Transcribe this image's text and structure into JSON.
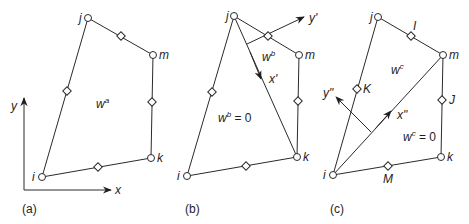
{
  "figure": {
    "panels": [
      {
        "caption": "(a)",
        "nodes": {
          "i": "i",
          "j": "j",
          "m": "m",
          "k": "k"
        },
        "axes": {
          "x": "x",
          "y": "y"
        },
        "field_label": {
          "base": "w",
          "sup": "a"
        }
      },
      {
        "caption": "(b)",
        "nodes": {
          "i": "i",
          "j": "j",
          "m": "m",
          "k": "k"
        },
        "axes": {
          "x": "x'",
          "y": "y'"
        },
        "field_label_upper": {
          "base": "w",
          "sup": "b"
        },
        "field_label_lower": {
          "base": "w",
          "sup": "b",
          "suffix": " = 0"
        }
      },
      {
        "caption": "(c)",
        "nodes": {
          "i": "i",
          "j": "j",
          "m": "m",
          "k": "k"
        },
        "midside_nodes": {
          "I": "I",
          "J": "J",
          "K": "K",
          "M": "M"
        },
        "axes": {
          "x": "x\"",
          "y": "y\""
        },
        "field_label_upper": {
          "base": "w",
          "sup": "c"
        },
        "field_label_lower": {
          "base": "w",
          "sup": "c",
          "suffix": " = 0"
        }
      }
    ],
    "colors": {
      "line": "#2a2a2a",
      "background": "#ffffff"
    }
  }
}
